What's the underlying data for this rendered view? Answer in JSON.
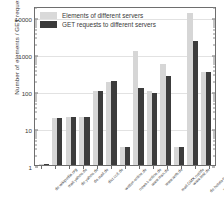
{
  "chart_data": {
    "type": "bar",
    "title": "",
    "xlabel": "",
    "ylabel": "Number of elements / GET requests",
    "yscale": "log",
    "ylim": [
      1,
      20000
    ],
    "ytick_labels": [
      "1",
      "10",
      "100",
      "1000",
      "10000"
    ],
    "ytick_values": [
      1,
      10,
      100,
      1000,
      10000
    ],
    "grid": true,
    "legend_position": "upper left",
    "categories": [
      "de.wikipedia.org",
      "mail.yahoo.de",
      "de.yahoo.de",
      "de.mail.de",
      "dict.cc/t.de",
      "wetter-online.de",
      "news.t-online.de",
      "www.msn.de",
      "www.web.de",
      "mail.GMX.net/de",
      "www.test.de",
      "de.hotels-hotel.de",
      "www.t-mobile.de"
    ],
    "series": [
      {
        "name": "Elements of different servers",
        "color": "#d6d6d6",
        "values": [
          1,
          19,
          20,
          20,
          100,
          180,
          3,
          1200,
          100,
          550,
          3,
          13000,
          330
        ]
      },
      {
        "name": "GET requests to different servers",
        "color": "#3c3c3c",
        "values": [
          1,
          19,
          20,
          20,
          102,
          185,
          3,
          120,
          90,
          250,
          3,
          2300,
          320
        ]
      }
    ]
  },
  "legend": {
    "items": [
      {
        "label": "Elements of different servers",
        "swatch": "light"
      },
      {
        "label": "GET requests to different servers",
        "swatch": "dark"
      }
    ]
  }
}
